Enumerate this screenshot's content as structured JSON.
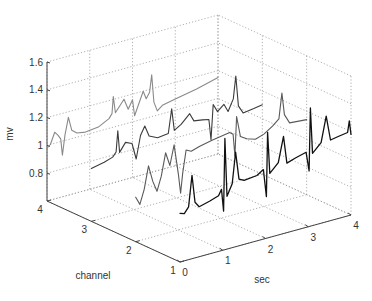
{
  "chart_data": {
    "type": "line3d",
    "title": "",
    "xlabel": "sec",
    "ylabel": "channel",
    "zlabel": "mv",
    "xlim": [
      0,
      4
    ],
    "ylim": [
      1,
      4
    ],
    "zlim": [
      0.6,
      1.6
    ],
    "x_ticks": [
      "0",
      "1",
      "2",
      "3",
      "4"
    ],
    "y_ticks": [
      "1",
      "2",
      "3",
      "4"
    ],
    "z_ticks": [
      "0.8",
      "1",
      "1.2",
      "1.4",
      "1.6"
    ],
    "grid": true,
    "series": [
      {
        "name": "channel 4",
        "channel": 4,
        "color": "#8a8a8a",
        "points": [
          [
            0,
            0.98
          ],
          [
            0.08,
            1.0
          ],
          [
            0.18,
            1.08
          ],
          [
            0.26,
            1.05
          ],
          [
            0.32,
            1.02
          ],
          [
            0.36,
            0.9
          ],
          [
            0.42,
            1.04
          ],
          [
            0.5,
            1.16
          ],
          [
            0.58,
            1.06
          ],
          [
            0.7,
            1.03
          ],
          [
            0.9,
            1.02
          ],
          [
            1.2,
            1.03
          ],
          [
            1.45,
            1.07
          ],
          [
            1.52,
            1.1
          ],
          [
            1.55,
            1.22
          ],
          [
            1.6,
            1.1
          ],
          [
            1.7,
            1.14
          ],
          [
            1.8,
            1.18
          ],
          [
            1.9,
            1.1
          ],
          [
            2.0,
            1.16
          ],
          [
            2.05,
            1.04
          ],
          [
            2.15,
            1.12
          ],
          [
            2.25,
            1.2
          ],
          [
            2.32,
            1.14
          ],
          [
            2.4,
            1.18
          ],
          [
            2.45,
            1.3
          ],
          [
            2.5,
            1.1
          ],
          [
            2.58,
            1.03
          ],
          [
            2.7,
            1.06
          ],
          [
            3.0,
            1.08
          ],
          [
            3.5,
            1.11
          ],
          [
            4.0,
            1.15
          ]
        ]
      },
      {
        "name": "channel 3",
        "channel": 3,
        "color": "#3c3c3c",
        "points": [
          [
            0,
            0.98
          ],
          [
            0.3,
            1.0
          ],
          [
            0.5,
            1.02
          ],
          [
            0.58,
            1.05
          ],
          [
            0.62,
            1.2
          ],
          [
            0.66,
            1.04
          ],
          [
            0.8,
            1.1
          ],
          [
            0.95,
            1.08
          ],
          [
            1.05,
            0.96
          ],
          [
            1.15,
            1.12
          ],
          [
            1.25,
            1.18
          ],
          [
            1.35,
            1.1
          ],
          [
            1.55,
            1.07
          ],
          [
            1.8,
            1.08
          ],
          [
            1.88,
            1.25
          ],
          [
            1.94,
            1.09
          ],
          [
            2.1,
            1.12
          ],
          [
            2.3,
            1.18
          ],
          [
            2.4,
            1.12
          ],
          [
            2.6,
            1.11
          ],
          [
            2.75,
            1.1
          ],
          [
            2.8,
            0.95
          ],
          [
            2.85,
            1.2
          ],
          [
            2.95,
            1.14
          ],
          [
            3.1,
            1.18
          ],
          [
            3.2,
            1.12
          ],
          [
            3.32,
            1.2
          ],
          [
            3.38,
            1.36
          ],
          [
            3.44,
            1.14
          ],
          [
            3.55,
            1.08
          ],
          [
            3.8,
            1.09
          ],
          [
            4.0,
            1.1
          ]
        ]
      },
      {
        "name": "channel 2",
        "channel": 2,
        "color": "#5a5a5a",
        "points": [
          [
            0,
            0.92
          ],
          [
            0.1,
            0.86
          ],
          [
            0.2,
            0.96
          ],
          [
            0.3,
            1.12
          ],
          [
            0.4,
            1.0
          ],
          [
            0.5,
            0.92
          ],
          [
            0.6,
            1.02
          ],
          [
            0.7,
            1.18
          ],
          [
            0.8,
            1.08
          ],
          [
            0.9,
            1.22
          ],
          [
            1.0,
            1.0
          ],
          [
            1.05,
            0.86
          ],
          [
            1.1,
            1.0
          ],
          [
            1.18,
            1.16
          ],
          [
            1.3,
            1.14
          ],
          [
            1.5,
            1.16
          ],
          [
            1.8,
            1.18
          ],
          [
            2.0,
            1.19
          ],
          [
            2.2,
            1.2
          ],
          [
            2.28,
            1.18
          ],
          [
            2.32,
            1.02
          ],
          [
            2.36,
            1.3
          ],
          [
            2.45,
            1.15
          ],
          [
            2.6,
            1.12
          ],
          [
            2.8,
            1.1
          ],
          [
            3.0,
            1.12
          ],
          [
            3.2,
            1.16
          ],
          [
            3.35,
            1.2
          ],
          [
            3.42,
            1.38
          ],
          [
            3.48,
            1.22
          ],
          [
            3.6,
            1.15
          ],
          [
            4.0,
            1.14
          ]
        ]
      },
      {
        "name": "channel 1",
        "channel": 1,
        "color": "#111111",
        "points": [
          [
            0,
            0.95
          ],
          [
            0.1,
            0.94
          ],
          [
            0.2,
            0.98
          ],
          [
            0.28,
            1.2
          ],
          [
            0.35,
            1.0
          ],
          [
            0.45,
            0.96
          ],
          [
            0.7,
            0.98
          ],
          [
            0.9,
            1.0
          ],
          [
            0.97,
            1.04
          ],
          [
            1.02,
            0.88
          ],
          [
            1.05,
            1.4
          ],
          [
            1.1,
            0.98
          ],
          [
            1.22,
            1.06
          ],
          [
            1.3,
            1.28
          ],
          [
            1.38,
            1.08
          ],
          [
            1.5,
            1.06
          ],
          [
            1.8,
            1.07
          ],
          [
            1.95,
            1.1
          ],
          [
            2.02,
            0.9
          ],
          [
            2.05,
            1.36
          ],
          [
            2.1,
            1.06
          ],
          [
            2.3,
            1.12
          ],
          [
            2.42,
            1.3
          ],
          [
            2.5,
            1.1
          ],
          [
            2.7,
            1.12
          ],
          [
            2.95,
            1.14
          ],
          [
            3.02,
            1.0
          ],
          [
            3.05,
            1.45
          ],
          [
            3.1,
            1.12
          ],
          [
            3.3,
            1.18
          ],
          [
            3.42,
            1.36
          ],
          [
            3.52,
            1.18
          ],
          [
            3.7,
            1.19
          ],
          [
            3.92,
            1.2
          ],
          [
            3.96,
            1.28
          ],
          [
            4.0,
            1.18
          ]
        ]
      }
    ]
  }
}
